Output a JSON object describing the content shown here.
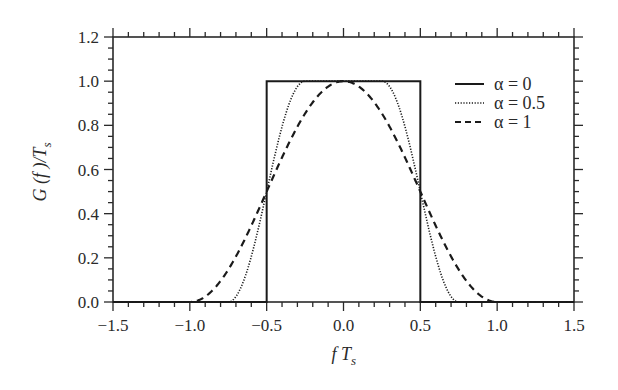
{
  "chart_data": {
    "type": "line",
    "title": "",
    "xlabel": "fT_s",
    "ylabel": "G(f)/T_s",
    "xlim": [
      -1.5,
      1.5
    ],
    "ylim": [
      0.0,
      1.2
    ],
    "xticks": [
      -1.5,
      -1.0,
      -0.5,
      0.0,
      0.5,
      1.0,
      1.5
    ],
    "xtick_labels": [
      "−1.5",
      "−1.0",
      "−0.5",
      "0.0",
      "0.5",
      "1.0",
      "1.5"
    ],
    "yticks": [
      0.0,
      0.2,
      0.4,
      0.6,
      0.8,
      1.0,
      1.2
    ],
    "ytick_labels": [
      "0.0",
      "0.2",
      "0.4",
      "0.6",
      "0.8",
      "1.0",
      "1.2"
    ],
    "minor_ticks_per_major_x": 5,
    "minor_ticks_per_major_y": 4,
    "grid": false,
    "legend_position": "upper right",
    "series": [
      {
        "name": "α = 0",
        "alpha": 0,
        "style": "solid",
        "x": [
          -1.5,
          -0.5,
          -0.5,
          0.5,
          0.5,
          1.5
        ],
        "y": [
          0.0,
          0.0,
          1.0,
          1.0,
          0.0,
          0.0
        ]
      },
      {
        "name": "α = 0.5",
        "alpha": 0.5,
        "style": "dotted",
        "x": [
          -1.5,
          -0.75,
          -0.7,
          -0.65,
          -0.6,
          -0.55,
          -0.5,
          -0.45,
          -0.4,
          -0.35,
          -0.3,
          -0.25,
          0.0,
          0.25,
          0.3,
          0.35,
          0.4,
          0.45,
          0.5,
          0.55,
          0.6,
          0.65,
          0.7,
          0.75,
          1.5
        ],
        "y": [
          0.0,
          0.0,
          0.024,
          0.095,
          0.206,
          0.345,
          0.5,
          0.655,
          0.794,
          0.905,
          0.976,
          1.0,
          1.0,
          1.0,
          0.976,
          0.905,
          0.794,
          0.655,
          0.5,
          0.345,
          0.206,
          0.095,
          0.024,
          0.0,
          0.0
        ]
      },
      {
        "name": "α = 1",
        "alpha": 1,
        "style": "dashed",
        "x": [
          -1.5,
          -1.0,
          -0.9,
          -0.8,
          -0.7,
          -0.6,
          -0.5,
          -0.4,
          -0.3,
          -0.2,
          -0.1,
          0.0,
          0.1,
          0.2,
          0.3,
          0.4,
          0.5,
          0.6,
          0.7,
          0.8,
          0.9,
          1.0,
          1.5
        ],
        "y": [
          0.0,
          0.0,
          0.024,
          0.095,
          0.206,
          0.345,
          0.5,
          0.655,
          0.794,
          0.905,
          0.976,
          1.0,
          0.976,
          0.905,
          0.794,
          0.655,
          0.5,
          0.345,
          0.206,
          0.095,
          0.024,
          0.0,
          0.0
        ]
      }
    ]
  },
  "legend": {
    "items": [
      {
        "label": "α = 0",
        "style": "solid"
      },
      {
        "label": "α = 0.5",
        "style": "dotted"
      },
      {
        "label": "α = 1",
        "style": "dashed"
      }
    ]
  },
  "colors": {
    "line": "#1a1a1a",
    "axis": "#2a2a2a",
    "background": "#ffffff"
  }
}
